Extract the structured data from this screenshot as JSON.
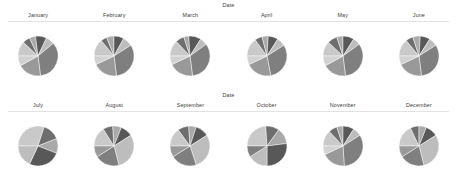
{
  "figure": {
    "kind": "pie-chart-trellis",
    "background": "#ffffff",
    "rows": 2,
    "columns": 6,
    "rule_color": "#e2e2e2",
    "label_color": "#3c3c3c",
    "slice_border_color": "#ffffff"
  },
  "rows": [
    {
      "facet_title": "Date",
      "panels": [
        {
          "label": "January"
        },
        {
          "label": "February"
        },
        {
          "label": "March"
        },
        {
          "label": "April"
        },
        {
          "label": "May"
        },
        {
          "label": "June"
        }
      ]
    },
    {
      "facet_title": "Date",
      "panels": [
        {
          "label": "July"
        },
        {
          "label": "August"
        },
        {
          "label": "September"
        },
        {
          "label": "October"
        },
        {
          "label": "November"
        },
        {
          "label": "December"
        }
      ]
    }
  ],
  "palette": [
    "#c9c9c9",
    "#6e6e6e",
    "#a9a9a9",
    "#585858",
    "#bdbdbd",
    "#7f7f7f",
    "#999999",
    "#d2d2d2",
    "#636363",
    "#b4b4b4"
  ],
  "chart_data": {
    "type": "pie",
    "title": "Date",
    "xlabel": "",
    "ylabel": "",
    "facet_variable": "Date",
    "facet_layout": [
      2,
      6
    ],
    "colormap": "greys",
    "colors": [
      "#c9c9c9",
      "#6e6e6e",
      "#a9a9a9",
      "#585858",
      "#bdbdbd",
      "#7f7f7f",
      "#999999",
      "#d2d2d2",
      "#636363",
      "#b4b4b4"
    ],
    "panels": [
      {
        "title": "January",
        "labels": [
          "s1",
          "s2",
          "s3",
          "s4",
          "s5",
          "s6",
          "s7",
          "s8"
        ],
        "values": [
          12,
          6,
          5,
          9,
          7,
          34,
          19,
          8
        ],
        "start_angle": 90,
        "radius_px": 20
      },
      {
        "title": "February",
        "labels": [
          "s1",
          "s2",
          "s3",
          "s4",
          "s5",
          "s6",
          "s7",
          "s8"
        ],
        "values": [
          14,
          5,
          6,
          8,
          8,
          32,
          20,
          7
        ],
        "start_angle": 90,
        "radius_px": 20
      },
      {
        "title": "March",
        "labels": [
          "s1",
          "s2",
          "s3",
          "s4",
          "s5",
          "s6",
          "s7",
          "s8"
        ],
        "values": [
          13,
          7,
          4,
          10,
          6,
          33,
          20,
          7
        ],
        "start_angle": 90,
        "radius_px": 20
      },
      {
        "title": "April",
        "labels": [
          "s1",
          "s2",
          "s3",
          "s4",
          "s5",
          "s6",
          "s7",
          "s8"
        ],
        "values": [
          15,
          6,
          5,
          8,
          7,
          31,
          21,
          7
        ],
        "start_angle": 90,
        "radius_px": 20
      },
      {
        "title": "May",
        "labels": [
          "s1",
          "s2",
          "s3",
          "s4",
          "s5",
          "s6",
          "s7",
          "s8"
        ],
        "values": [
          12,
          8,
          5,
          9,
          6,
          33,
          19,
          8
        ],
        "start_angle": 90,
        "radius_px": 20
      },
      {
        "title": "June",
        "labels": [
          "s1",
          "s2",
          "s3",
          "s4",
          "s5",
          "s6",
          "s7",
          "s8"
        ],
        "values": [
          14,
          6,
          6,
          8,
          7,
          32,
          20,
          7
        ],
        "start_angle": 90,
        "radius_px": 20
      },
      {
        "title": "July",
        "labels": [
          "s1",
          "s2",
          "s3",
          "s4",
          "s5"
        ],
        "values": [
          30,
          14,
          12,
          26,
          18
        ],
        "start_angle": 90,
        "radius_px": 20
      },
      {
        "title": "August",
        "labels": [
          "s1",
          "s2",
          "s3",
          "s4",
          "s5",
          "s6",
          "s7"
        ],
        "values": [
          16,
          8,
          7,
          10,
          30,
          20,
          9
        ],
        "start_angle": 90,
        "radius_px": 20
      },
      {
        "title": "September",
        "labels": [
          "s1",
          "s2",
          "s3",
          "s4",
          "s5",
          "s6",
          "s7"
        ],
        "values": [
          15,
          9,
          6,
          11,
          29,
          21,
          9
        ],
        "start_angle": 90,
        "radius_px": 20
      },
      {
        "title": "October",
        "labels": [
          "s1",
          "s2",
          "s3",
          "s4",
          "s5",
          "s6"
        ],
        "values": [
          24,
          11,
          13,
          27,
          16,
          9
        ],
        "start_angle": 90,
        "radius_px": 20
      },
      {
        "title": "November",
        "labels": [
          "s1",
          "s2",
          "s3",
          "s4",
          "s5",
          "s6",
          "s7",
          "s8"
        ],
        "values": [
          13,
          7,
          5,
          9,
          7,
          33,
          19,
          7
        ],
        "start_angle": 90,
        "radius_px": 20
      },
      {
        "title": "December",
        "labels": [
          "s1",
          "s2",
          "s3",
          "s4",
          "s5",
          "s6",
          "s7"
        ],
        "values": [
          18,
          7,
          6,
          10,
          30,
          20,
          9
        ],
        "start_angle": 90,
        "radius_px": 20
      }
    ]
  }
}
